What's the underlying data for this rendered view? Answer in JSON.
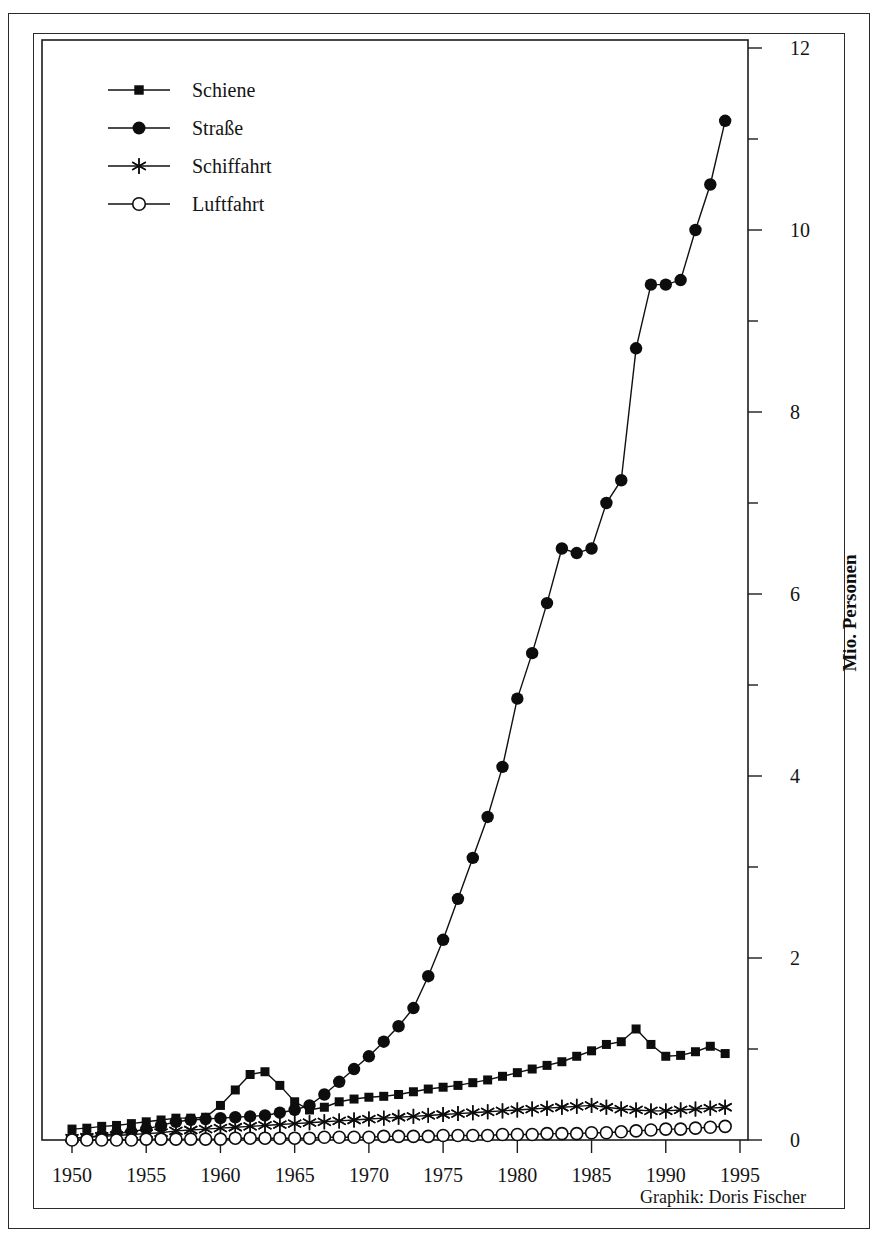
{
  "credit": "Graphik: Doris Fischer",
  "chart_data": {
    "type": "line",
    "title": "",
    "subtitle": "",
    "xlabel": "",
    "ylabel": "Mio. Personen",
    "xlim": [
      1949,
      1995
    ],
    "ylim": [
      0,
      12
    ],
    "grid": false,
    "legend_position": "top-left",
    "x_tick_labels": [
      "1950",
      "1955",
      "1960",
      "1965",
      "1970",
      "1975",
      "1980",
      "1985",
      "1990",
      "1995"
    ],
    "x_ticks": [
      1950,
      1955,
      1960,
      1965,
      1970,
      1975,
      1980,
      1985,
      1990,
      1995
    ],
    "y_tick_labels": [
      "0",
      "2",
      "4",
      "6",
      "8",
      "10",
      "12"
    ],
    "y_ticks": [
      0,
      2,
      4,
      6,
      8,
      10,
      12
    ],
    "y_minor_ticks": [
      1,
      3,
      5,
      7,
      9,
      11
    ],
    "x": [
      1950,
      1951,
      1952,
      1953,
      1954,
      1955,
      1956,
      1957,
      1958,
      1959,
      1960,
      1961,
      1962,
      1963,
      1964,
      1965,
      1966,
      1967,
      1968,
      1969,
      1970,
      1971,
      1972,
      1973,
      1974,
      1975,
      1976,
      1977,
      1978,
      1979,
      1980,
      1981,
      1982,
      1983,
      1984,
      1985,
      1986,
      1987,
      1988,
      1989,
      1990,
      1991,
      1992,
      1993,
      1994
    ],
    "series": [
      {
        "name": "Schiene",
        "marker": "square-filled",
        "values": [
          0.12,
          0.13,
          0.15,
          0.16,
          0.18,
          0.2,
          0.22,
          0.24,
          0.24,
          0.25,
          0.38,
          0.55,
          0.72,
          0.75,
          0.6,
          0.42,
          0.33,
          0.36,
          0.42,
          0.45,
          0.47,
          0.48,
          0.5,
          0.53,
          0.56,
          0.58,
          0.6,
          0.63,
          0.66,
          0.7,
          0.74,
          0.78,
          0.82,
          0.86,
          0.92,
          0.98,
          1.05,
          1.08,
          1.22,
          1.05,
          0.92,
          0.93,
          0.97,
          1.03,
          0.95
        ]
      },
      {
        "name": "Straße",
        "marker": "circle-filled",
        "values": [
          0.02,
          0.03,
          0.05,
          0.07,
          0.09,
          0.12,
          0.16,
          0.2,
          0.22,
          0.23,
          0.24,
          0.25,
          0.26,
          0.27,
          0.3,
          0.33,
          0.38,
          0.5,
          0.64,
          0.78,
          0.92,
          1.08,
          1.25,
          1.45,
          1.8,
          2.2,
          2.65,
          3.1,
          3.55,
          4.1,
          4.85,
          5.35,
          5.9,
          6.5,
          6.45,
          6.5,
          7.0,
          7.25,
          8.7,
          9.4,
          9.4,
          9.45,
          10.0,
          10.5,
          11.2
        ]
      },
      {
        "name": "Schiffahrt",
        "marker": "asterisk",
        "values": [
          0.02,
          0.03,
          0.04,
          0.05,
          0.06,
          0.07,
          0.08,
          0.1,
          0.11,
          0.12,
          0.13,
          0.14,
          0.15,
          0.16,
          0.17,
          0.18,
          0.19,
          0.2,
          0.21,
          0.22,
          0.23,
          0.24,
          0.25,
          0.26,
          0.27,
          0.28,
          0.29,
          0.3,
          0.31,
          0.32,
          0.33,
          0.34,
          0.35,
          0.36,
          0.37,
          0.38,
          0.36,
          0.34,
          0.33,
          0.32,
          0.32,
          0.33,
          0.34,
          0.35,
          0.36
        ]
      },
      {
        "name": "Luftfahrt",
        "marker": "circle-open",
        "values": [
          0.0,
          0.0,
          0.0,
          0.0,
          0.0,
          0.01,
          0.01,
          0.01,
          0.01,
          0.01,
          0.01,
          0.02,
          0.02,
          0.02,
          0.02,
          0.02,
          0.02,
          0.03,
          0.03,
          0.03,
          0.03,
          0.04,
          0.04,
          0.04,
          0.04,
          0.05,
          0.05,
          0.05,
          0.05,
          0.06,
          0.06,
          0.06,
          0.07,
          0.07,
          0.07,
          0.08,
          0.08,
          0.09,
          0.1,
          0.11,
          0.12,
          0.12,
          0.13,
          0.14,
          0.15
        ]
      }
    ]
  }
}
